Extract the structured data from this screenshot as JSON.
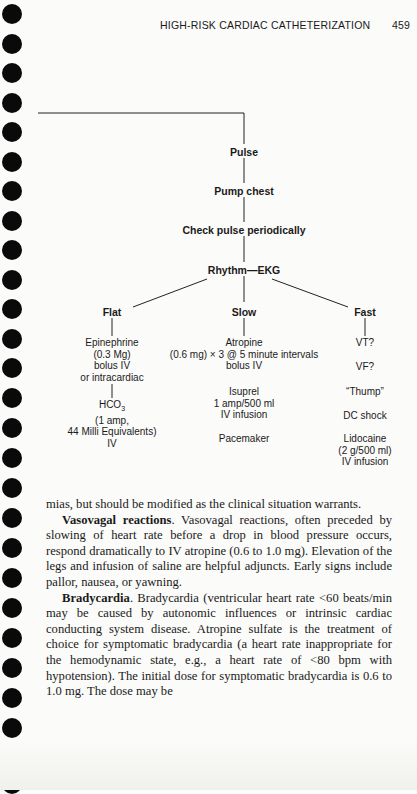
{
  "header": {
    "running_title": "HIGH-RISK CARDIAC CATHETERIZATION",
    "page_number": "459"
  },
  "binder_holes": {
    "count": 27,
    "spacing_px": 29.5,
    "color": "#0a0a0a"
  },
  "flowchart": {
    "nodes": {
      "pulse": "Pulse",
      "pump_chest": "Pump chest",
      "check_pulse": "Check pulse periodically",
      "rhythm": "Rhythm",
      "rhythm_dash": "—",
      "ekg": "EKG"
    },
    "branches": {
      "flat": {
        "label": "Flat",
        "block1": [
          "Epinephrine",
          "(0.3 Mg)",
          "bolus IV",
          "or intracardiac"
        ],
        "block2_chem": "HCO",
        "block2_sub": "3",
        "block2": [
          "(1 amp,",
          "44 Milli Equivalents)",
          "IV"
        ]
      },
      "slow": {
        "label": "Slow",
        "block1": [
          "Atropine",
          "(0.6 mg) × 3 @ 5 minute intervals",
          "bolus IV"
        ],
        "block2": [
          "Isuprel",
          "1 amp/500 ml",
          "IV infusion"
        ],
        "block3": [
          "Pacemaker"
        ]
      },
      "fast": {
        "label": "Fast",
        "items": [
          "VT?",
          "VF?",
          "“Thump”",
          "DC shock"
        ],
        "lidocaine": [
          "Lidocaine",
          "(2 g/500 ml)",
          "IV infusion"
        ]
      }
    }
  },
  "body": {
    "p1": "mias, but should be modified as the clinical situation warrants.",
    "p2_heading": "Vasovagal reactions",
    "p2_text": ". Vasovagal reactions, often preceded by slowing of heart rate before a drop in blood pressure occurs, respond dramatically to IV atropine (0.6 to 1.0 mg). Elevation of the legs and infusion of saline are helpful adjuncts. Early signs include pallor, nausea, or yawning.",
    "p3_heading": "Bradycardia",
    "p3_text": ". Bradycardia (ventricular heart rate <60 beats/min may be caused by autonomic influences or intrinsic cardiac conducting system disease. Atropine sulfate is the treatment of choice for symptomatic bradycardia (a heart rate inappropriate for the hemodynamic state, e.g., a heart rate of <80 bpm with hypotension). The initial dose for symptomatic bradycardia is 0.6 to 1.0 mg. The dose may be"
  }
}
